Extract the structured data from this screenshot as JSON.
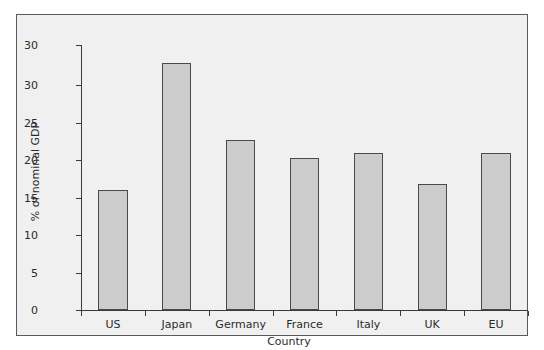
{
  "chart_data": {
    "type": "bar",
    "title": "",
    "xlabel": "Country",
    "ylabel": "% of nominal GDP",
    "categories": [
      "US",
      "Japan",
      "Germany",
      "France",
      "Italy",
      "UK",
      "EU"
    ],
    "values": [
      16.0,
      33.0,
      22.7,
      20.3,
      21.0,
      16.8,
      21.0
    ],
    "ylim": [
      0,
      30
    ],
    "yticks": [
      0,
      5,
      10,
      15,
      20,
      25,
      30
    ],
    "ytick_labels": [
      "0",
      "5",
      "10",
      "15",
      "20",
      "25",
      "30"
    ],
    "extra_top_tick_label": "30",
    "grid": false,
    "legend": null,
    "bar_fill_color": "#cccccc",
    "bar_edge_color": "#4a4a4a",
    "panel_background_color": "#f0f0f0",
    "figure_background_color": "#ffffff",
    "axis_color": "#3a3a3a",
    "text_color": "#2b2b2b"
  }
}
